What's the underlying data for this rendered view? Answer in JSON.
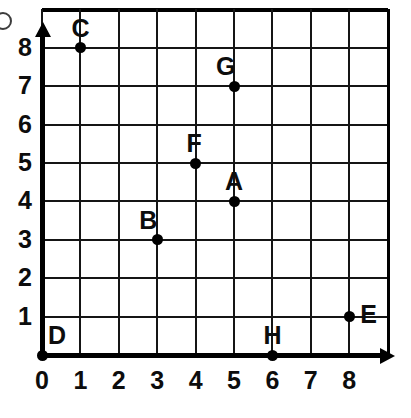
{
  "figure": {
    "type": "coordinate-grid",
    "artifact_icon": "partial-circle-mark"
  },
  "axes": {
    "x": {
      "label": "",
      "ticks": [
        "0",
        "1",
        "2",
        "3",
        "4",
        "5",
        "6",
        "7",
        "8"
      ],
      "min": 0,
      "max": 8,
      "arrow": "arrow-right-icon"
    },
    "y": {
      "label": "",
      "ticks": [
        "0",
        "1",
        "2",
        "3",
        "4",
        "5",
        "6",
        "7",
        "8"
      ],
      "min": 0,
      "max": 8,
      "arrow": "arrow-up-icon"
    }
  },
  "grid": {
    "visible": true,
    "columns": 9,
    "rows": 9,
    "color": "#151515"
  },
  "chart_data": {
    "type": "scatter",
    "title": "",
    "xlabel": "",
    "ylabel": "",
    "xlim": [
      0,
      8
    ],
    "ylim": [
      0,
      8
    ],
    "grid": true,
    "legend": "none",
    "point_labels": [
      "A",
      "B",
      "C",
      "D",
      "E",
      "F",
      "G",
      "H"
    ],
    "x": [
      5,
      3,
      1,
      0,
      8,
      4,
      5,
      6
    ],
    "y": [
      4,
      3,
      8,
      0,
      1,
      5,
      7,
      0
    ],
    "points": [
      {
        "label": "A",
        "x": 5,
        "y": 4,
        "label_pos": "above"
      },
      {
        "label": "B",
        "x": 3,
        "y": 3,
        "label_pos": "above-left"
      },
      {
        "label": "C",
        "x": 1,
        "y": 8,
        "label_pos": "above"
      },
      {
        "label": "D",
        "x": 0,
        "y": 0,
        "label_pos": "upper-right"
      },
      {
        "label": "E",
        "x": 8,
        "y": 1,
        "label_pos": "right"
      },
      {
        "label": "F",
        "x": 4,
        "y": 5,
        "label_pos": "above"
      },
      {
        "label": "G",
        "x": 5,
        "y": 7,
        "label_pos": "above-left"
      },
      {
        "label": "H",
        "x": 6,
        "y": 0,
        "label_pos": "above"
      }
    ]
  }
}
